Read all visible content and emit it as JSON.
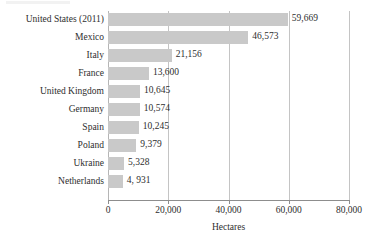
{
  "chart_data": {
    "type": "bar",
    "orientation": "horizontal",
    "title": "",
    "xlabel": "Hectares",
    "ylabel": "",
    "xlim": [
      0,
      80000
    ],
    "grid": true,
    "legend": null,
    "categories": [
      "United States (2011)",
      "Mexico",
      "Italy",
      "France",
      "United Kingdom",
      "Germany",
      "Spain",
      "Poland",
      "Ukraine",
      "Netherlands"
    ],
    "values": [
      59669,
      46573,
      21156,
      13600,
      10645,
      10574,
      10245,
      9379,
      5328,
      4931
    ],
    "value_labels": [
      "59,669",
      "46,573",
      "21,156",
      "13,600",
      "10,645",
      "10,574",
      "10,245",
      "9,379",
      "5,328",
      "4, 931"
    ],
    "xticks": [
      0,
      20000,
      40000,
      60000,
      80000
    ],
    "xtick_labels": [
      "0",
      "20,000",
      "40,000",
      "60,000",
      "80,000"
    ],
    "bar_color": "#c9c9c9",
    "grid_color": "#c4c4c4",
    "axis_color": "#8d8d8d",
    "background_color": "#ffffff"
  }
}
